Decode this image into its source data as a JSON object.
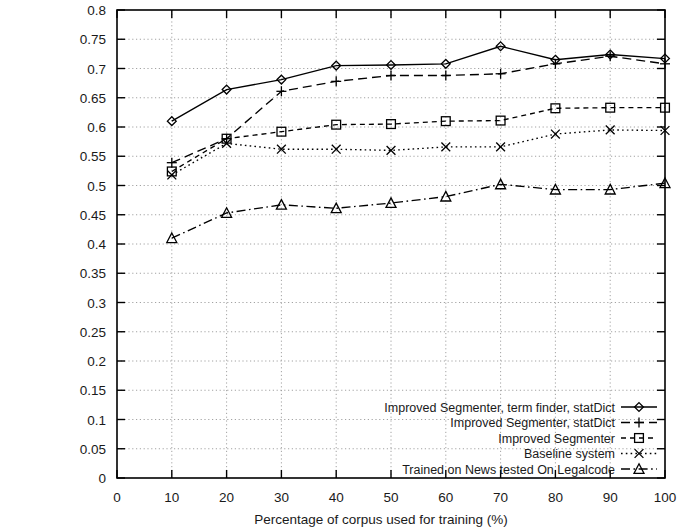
{
  "chart_data": {
    "type": "line",
    "title": "",
    "subtitle": "",
    "xlabel": "Percentage of corpus used for training (%)",
    "ylabel": "",
    "xlim": [
      0,
      100
    ],
    "ylim": [
      0,
      0.8
    ],
    "grid": true,
    "legend_position": "bottom-right",
    "xticks": [
      "0",
      "10",
      "20",
      "30",
      "40",
      "50",
      "60",
      "70",
      "80",
      "90",
      "100"
    ],
    "yticks": [
      "0",
      "0.05",
      "0.1",
      "0.15",
      "0.2",
      "0.25",
      "0.3",
      "0.35",
      "0.4",
      "0.45",
      "0.5",
      "0.55",
      "0.6",
      "0.65",
      "0.7",
      "0.75",
      "0.8"
    ],
    "x": [
      10,
      20,
      30,
      40,
      50,
      60,
      70,
      80,
      90,
      100
    ],
    "series": [
      {
        "name": "Improved Segmenter, term finder, statDict",
        "marker": "diamond",
        "linestyle": "solid",
        "values": [
          0.61,
          0.664,
          0.681,
          0.705,
          0.706,
          0.708,
          0.738,
          0.715,
          0.724,
          0.717
        ]
      },
      {
        "name": "Improved Segmenter, statDict",
        "marker": "plus",
        "linestyle": "dashed",
        "values": [
          0.539,
          0.58,
          0.661,
          0.678,
          0.688,
          0.688,
          0.691,
          0.708,
          0.721,
          0.708
        ]
      },
      {
        "name": "Improved Segmenter",
        "marker": "square",
        "linestyle": "dotted-dash",
        "values": [
          0.524,
          0.58,
          0.592,
          0.604,
          0.605,
          0.61,
          0.611,
          0.632,
          0.633,
          0.633
        ]
      },
      {
        "name": "Baseline system",
        "marker": "cross",
        "linestyle": "dotted",
        "values": [
          0.518,
          0.572,
          0.562,
          0.562,
          0.56,
          0.566,
          0.566,
          0.588,
          0.595,
          0.594
        ]
      },
      {
        "name": "Trained on News tested On Legalcode",
        "marker": "triangle",
        "linestyle": "dash-dot",
        "values": [
          0.41,
          0.453,
          0.467,
          0.461,
          0.47,
          0.481,
          0.502,
          0.493,
          0.493,
          0.504
        ]
      }
    ]
  },
  "legend": {
    "entries": [
      "Improved Segmenter, term finder, statDict",
      "Improved Segmenter, statDict",
      "Improved Segmenter",
      "Baseline system",
      "Trained on News tested On Legalcode"
    ]
  },
  "colors": {
    "ink": "#000000",
    "grid": "#8c8c8c",
    "background": "#ffffff"
  }
}
